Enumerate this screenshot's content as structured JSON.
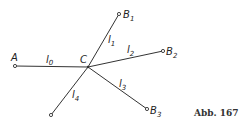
{
  "diagram": {
    "type": "graph",
    "stroke_color": "#333333",
    "nodes": [
      {
        "id": "A",
        "label": "A",
        "sub": "",
        "x": 15,
        "y": 66
      },
      {
        "id": "C",
        "label": "C",
        "sub": "",
        "x": 88,
        "y": 67
      },
      {
        "id": "B1",
        "label": "B",
        "sub": "1",
        "x": 119,
        "y": 14
      },
      {
        "id": "B2",
        "label": "B",
        "sub": "2",
        "x": 163,
        "y": 51
      },
      {
        "id": "B3",
        "label": "B",
        "sub": "3",
        "x": 147,
        "y": 109
      },
      {
        "id": "D",
        "label": "",
        "sub": "",
        "x": 51,
        "y": 115
      }
    ],
    "edges": [
      {
        "from": "A",
        "to": "C",
        "label": "l",
        "sub": "0"
      },
      {
        "from": "C",
        "to": "B1",
        "label": "l",
        "sub": "1"
      },
      {
        "from": "C",
        "to": "B2",
        "label": "l",
        "sub": "2"
      },
      {
        "from": "C",
        "to": "B3",
        "label": "l",
        "sub": "3"
      },
      {
        "from": "C",
        "to": "D",
        "label": "l",
        "sub": "4"
      }
    ],
    "labels": {
      "A": "A",
      "C": "C",
      "B": "B",
      "B1_sub": "1",
      "B2_sub": "2",
      "B3_sub": "3",
      "l": "l",
      "l0_sub": "0",
      "l1_sub": "1",
      "l2_sub": "2",
      "l3_sub": "3",
      "l4_sub": "4"
    },
    "caption": "Abb. 167"
  }
}
